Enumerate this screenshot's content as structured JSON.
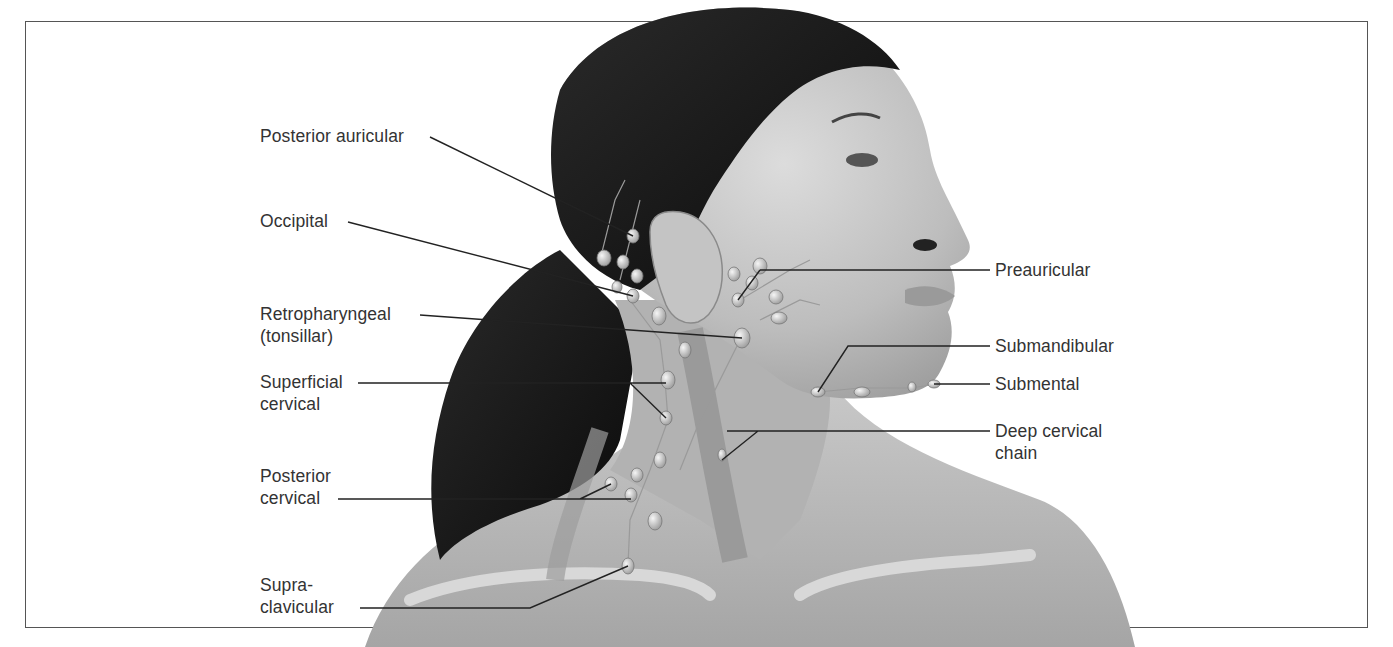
{
  "figure": {
    "palette": {
      "background": "#ffffff",
      "frame": "#555555",
      "hair": "#141414",
      "skin_light": "#d6d6d6",
      "skin_mid": "#a9a9a9",
      "muscle": "#8f8f8f",
      "node": "#e6e6e6",
      "leader_line": "#222222",
      "label_text": "#333333"
    }
  },
  "labels_left": [
    {
      "id": "posterior-auricular",
      "lines": [
        "Posterior auricular"
      ]
    },
    {
      "id": "occipital",
      "lines": [
        "Occipital"
      ]
    },
    {
      "id": "retropharyngeal",
      "lines": [
        "Retropharyngeal",
        "(tonsillar)"
      ]
    },
    {
      "id": "superficial-cervical",
      "lines": [
        "Superficial",
        "cervical"
      ]
    },
    {
      "id": "posterior-cervical",
      "lines": [
        "Posterior",
        "cervical"
      ]
    },
    {
      "id": "supraclavicular",
      "lines": [
        "Supra-",
        "clavicular"
      ]
    }
  ],
  "labels_right": [
    {
      "id": "preauricular",
      "lines": [
        "Preauricular"
      ]
    },
    {
      "id": "submandibular",
      "lines": [
        "Submandibular"
      ]
    },
    {
      "id": "submental",
      "lines": [
        "Submental"
      ]
    },
    {
      "id": "deep-cervical-chain",
      "lines": [
        "Deep cervical",
        "chain"
      ]
    }
  ]
}
